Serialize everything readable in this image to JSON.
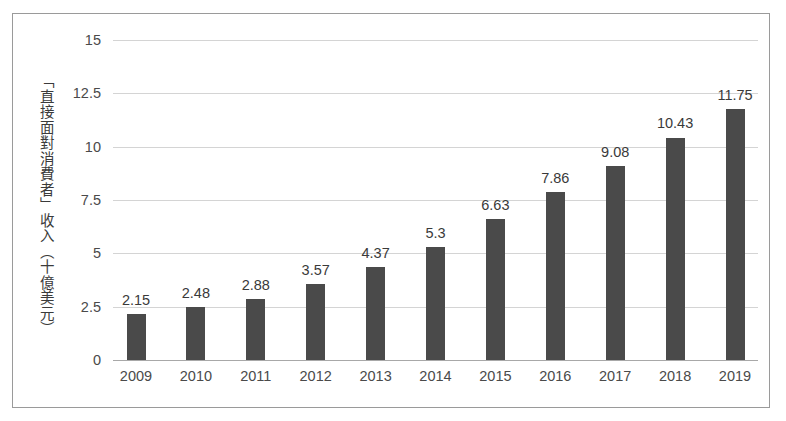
{
  "chart_data": {
    "type": "bar",
    "title": "",
    "subtitle": "",
    "xlabel": "",
    "ylabel": "「直接面對消費者」收入（十億美元）",
    "categories": [
      "2009",
      "2010",
      "2011",
      "2012",
      "2013",
      "2014",
      "2015",
      "2016",
      "2017",
      "2018",
      "2019"
    ],
    "values": [
      2.15,
      2.48,
      2.88,
      3.57,
      4.37,
      5.3,
      6.63,
      7.86,
      9.08,
      10.43,
      11.75
    ],
    "value_labels": [
      "2.15",
      "2.48",
      "2.88",
      "3.57",
      "4.37",
      "5.3",
      "6.63",
      "7.86",
      "9.08",
      "10.43",
      "11.75"
    ],
    "ylim": [
      0,
      15
    ],
    "y_ticks": [
      0,
      2.5,
      5,
      7.5,
      10,
      12.5,
      15
    ],
    "y_tick_labels": [
      "0",
      "2.5",
      "5",
      "7.5",
      "10",
      "12.5",
      "15"
    ],
    "grid": true,
    "grid_axis": "y",
    "legend": false,
    "legend_position": "none",
    "bar_color": "#4a4a4a",
    "gridline_color": "#d4d4d4",
    "axis_color": "#a8a8a8",
    "text_color": "#4a4a4a",
    "background_color": "#ffffff",
    "frame_color": "#9a9a9a"
  }
}
